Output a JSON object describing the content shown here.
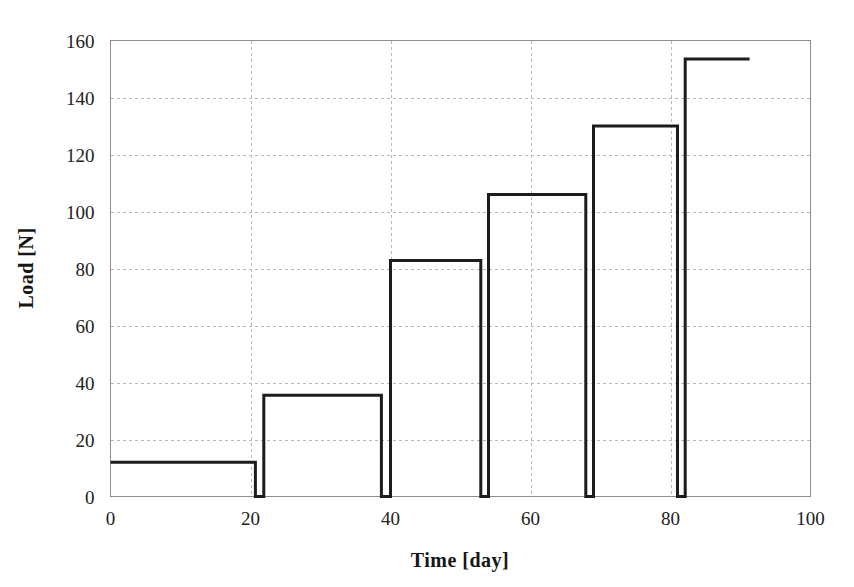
{
  "chart_data": {
    "type": "line",
    "title": "",
    "subtitle": "",
    "xlabel": "Time [day]",
    "ylabel": "Load [N]",
    "xlim": [
      0,
      100
    ],
    "ylim": [
      0,
      160
    ],
    "xticks": [
      0,
      20,
      40,
      60,
      80,
      100
    ],
    "yticks": [
      0,
      20,
      40,
      60,
      80,
      100,
      120,
      140,
      160
    ],
    "xtick_labels": [
      "0",
      "20",
      "40",
      "60",
      "80",
      "100"
    ],
    "ytick_labels": [
      "0",
      "20",
      "40",
      "60",
      "80",
      "100",
      "120",
      "140",
      "160"
    ],
    "grid": true,
    "grid_style": "dashed",
    "legend": null,
    "legend_position": "none",
    "line_color": "#1c1c1c",
    "grid_color": "#b9b9b9",
    "frame_color": "#8d8d8d",
    "background_color": "#ffffff",
    "series": [
      {
        "name": "Load staircase",
        "description": "Stepwise increasing sustained load; load drops to zero briefly between successive steps.",
        "steps": [
          {
            "index": 1,
            "load": 12.0,
            "start_day": 0.0,
            "end_day": 20.7
          },
          {
            "index": 2,
            "load": 35.5,
            "start_day": 21.9,
            "end_day": 38.7
          },
          {
            "index": 3,
            "load": 82.8,
            "start_day": 40.0,
            "end_day": 52.9
          },
          {
            "index": 4,
            "load": 106.0,
            "start_day": 54.0,
            "end_day": 67.9
          },
          {
            "index": 5,
            "load": 130.0,
            "start_day": 69.0,
            "end_day": 81.0
          },
          {
            "index": 6,
            "load": 153.5,
            "start_day": 82.1,
            "end_day": 91.3
          }
        ],
        "x": [
          0.0,
          20.7,
          20.7,
          21.9,
          21.9,
          38.7,
          38.7,
          40.0,
          40.0,
          52.9,
          52.9,
          54.0,
          54.0,
          67.9,
          67.9,
          69.0,
          69.0,
          81.0,
          81.0,
          82.1,
          82.1,
          91.3
        ],
        "y": [
          12.0,
          12.0,
          0.0,
          0.0,
          35.5,
          35.5,
          0.0,
          0.0,
          82.8,
          82.8,
          0.0,
          0.0,
          106.0,
          106.0,
          0.0,
          0.0,
          130.0,
          130.0,
          0.0,
          0.0,
          153.5,
          153.5
        ]
      }
    ]
  },
  "figure": {
    "axis_x_title": "Time [day]",
    "axis_y_title": "Load [N]"
  }
}
